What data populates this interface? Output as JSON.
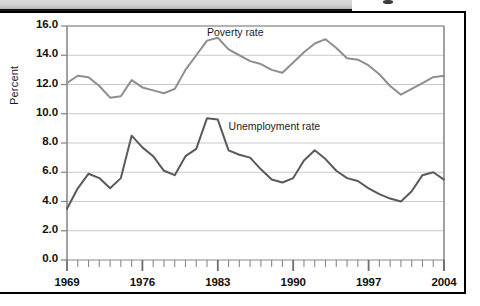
{
  "header": {
    "strip_present": true,
    "strip_color": "#cfcfcf"
  },
  "figure": {
    "ylabel": "Percent",
    "series_labels": {
      "poverty": "Poverty rate",
      "unemployment": "Unemployment rate"
    }
  },
  "chart_data": {
    "type": "line",
    "title": "",
    "xlabel": "",
    "ylabel": "Percent",
    "xlim": [
      1969,
      2004
    ],
    "ylim": [
      0.0,
      16.0
    ],
    "ytick_labels": [
      "16.0",
      "14.0",
      "12.0",
      "10.0",
      "8.0",
      "6.0",
      "4.0",
      "2.0",
      "0.0"
    ],
    "ytick_values": [
      16.0,
      14.0,
      12.0,
      10.0,
      8.0,
      6.0,
      4.0,
      2.0,
      0.0
    ],
    "xtick_labels": [
      "1969",
      "1976",
      "1983",
      "1990",
      "1997",
      "2004"
    ],
    "xtick_values": [
      1969,
      1976,
      1983,
      1990,
      1997,
      2004
    ],
    "minor_xticks_every": 1,
    "grid": "horizontal",
    "legend_position": "inline-annotation",
    "x": [
      1969,
      1970,
      1971,
      1972,
      1973,
      1974,
      1975,
      1976,
      1977,
      1978,
      1979,
      1980,
      1981,
      1982,
      1983,
      1984,
      1985,
      1986,
      1987,
      1988,
      1989,
      1990,
      1991,
      1992,
      1993,
      1994,
      1995,
      1996,
      1997,
      1998,
      1999,
      2000,
      2001,
      2002,
      2003,
      2004
    ],
    "series": [
      {
        "name": "Poverty rate",
        "color": "#8e8e8e",
        "values": [
          12.1,
          12.6,
          12.5,
          11.9,
          11.1,
          11.2,
          12.3,
          11.8,
          11.6,
          11.4,
          11.7,
          13.0,
          14.0,
          15.0,
          15.2,
          14.4,
          14.0,
          13.6,
          13.4,
          13.0,
          12.8,
          13.5,
          14.2,
          14.8,
          15.1,
          14.5,
          13.8,
          13.7,
          13.3,
          12.7,
          11.9,
          11.3,
          11.7,
          12.1,
          12.5,
          12.6
        ]
      },
      {
        "name": "Unemployment rate",
        "color": "#5a5a5a",
        "values": [
          3.5,
          4.9,
          5.9,
          5.6,
          4.9,
          5.6,
          8.5,
          7.7,
          7.1,
          6.1,
          5.8,
          7.1,
          7.6,
          9.7,
          9.6,
          7.5,
          7.2,
          7.0,
          6.2,
          5.5,
          5.3,
          5.6,
          6.8,
          7.5,
          6.9,
          6.1,
          5.6,
          5.4,
          4.9,
          4.5,
          4.2,
          4.0,
          4.7,
          5.8,
          6.0,
          5.5
        ]
      }
    ],
    "annotations": [
      {
        "text": "Poverty rate",
        "x": 1982.0,
        "y": 15.5
      },
      {
        "text": "Unemployment rate",
        "x": 1984.0,
        "y": 9.1
      }
    ]
  }
}
